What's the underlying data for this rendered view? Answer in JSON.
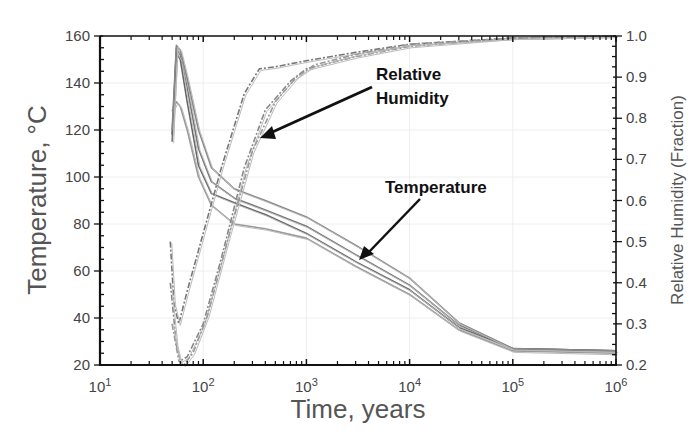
{
  "chart_data": {
    "type": "line",
    "title": "",
    "xlabel": "Time, years",
    "ylabel": "Temperature, °C",
    "y2label": "Relative Humidity (Fraction)",
    "xscale": "log",
    "xlim": [
      10,
      1000000
    ],
    "ylim": [
      20,
      160
    ],
    "y2lim": [
      0.2,
      1.0
    ],
    "grid": true,
    "legend": "none",
    "x_ticks": [
      "10^1",
      "10^2",
      "10^3",
      "10^4",
      "10^5",
      "10^6"
    ],
    "x_tick_values": [
      10,
      100,
      1000,
      10000,
      100000,
      1000000
    ],
    "y_ticks": [
      20,
      40,
      60,
      80,
      100,
      120,
      140,
      160
    ],
    "y2_ticks": [
      0.2,
      0.3,
      0.4,
      0.5,
      0.6,
      0.7,
      0.8,
      0.9,
      1.0
    ],
    "annotations": [
      {
        "text": "Relative Humidity",
        "points_to": {
          "x": 380,
          "y2": 0.78
        }
      },
      {
        "text": "Temperature",
        "points_to": {
          "x": 3500,
          "y": 62
        }
      }
    ],
    "series": [
      {
        "name": "Temperature (high case)",
        "axis": "left",
        "x": [
          50,
          55,
          60,
          70,
          90,
          120,
          200,
          400,
          1000,
          3000,
          10000,
          30000,
          100000,
          1000000
        ],
        "y": [
          115,
          155,
          152,
          138,
          112,
          98,
          91,
          86,
          79,
          67,
          54,
          37,
          27,
          26
        ]
      },
      {
        "name": "Temperature (mid case)",
        "axis": "left",
        "x": [
          50,
          55,
          60,
          70,
          90,
          120,
          200,
          400,
          1000,
          3000,
          10000,
          30000,
          100000,
          1000000
        ],
        "y": [
          118,
          153,
          150,
          132,
          105,
          93,
          89,
          84,
          76,
          64,
          52,
          36,
          27,
          26
        ]
      },
      {
        "name": "Temperature (low case)",
        "axis": "left",
        "x": [
          50,
          55,
          60,
          70,
          90,
          120,
          200,
          400,
          1000,
          3000,
          10000,
          30000,
          100000,
          1000000
        ],
        "y": [
          128,
          132,
          130,
          120,
          100,
          88,
          80,
          78,
          74,
          62,
          50,
          35,
          26,
          25
        ]
      },
      {
        "name": "Temperature (upper envelope)",
        "axis": "left",
        "x": [
          50,
          55,
          60,
          70,
          90,
          120,
          200,
          400,
          1000,
          3000,
          10000,
          30000,
          100000,
          1000000
        ],
        "y": [
          120,
          156,
          154,
          142,
          120,
          104,
          95,
          90,
          83,
          71,
          57,
          38,
          27,
          26
        ]
      },
      {
        "name": "Relative Humidity (fast case)",
        "axis": "right",
        "x": [
          48,
          52,
          58,
          70,
          100,
          150,
          250,
          350,
          500,
          1000,
          3000,
          10000,
          100000,
          1000000
        ],
        "y": [
          0.5,
          0.35,
          0.3,
          0.38,
          0.52,
          0.68,
          0.86,
          0.92,
          0.925,
          0.94,
          0.96,
          0.98,
          0.995,
          1.0
        ]
      },
      {
        "name": "Relative Humidity (mid case)",
        "axis": "right",
        "x": [
          48,
          55,
          60,
          70,
          100,
          150,
          250,
          400,
          700,
          1000,
          3000,
          10000,
          100000,
          1000000
        ],
        "y": [
          0.4,
          0.25,
          0.21,
          0.22,
          0.3,
          0.46,
          0.68,
          0.82,
          0.89,
          0.92,
          0.95,
          0.975,
          0.995,
          1.0
        ]
      },
      {
        "name": "Relative Humidity (slow case)",
        "axis": "right",
        "x": [
          50,
          58,
          65,
          80,
          110,
          180,
          300,
          500,
          800,
          1200,
          3000,
          10000,
          100000,
          1000000
        ],
        "y": [
          0.3,
          0.21,
          0.2,
          0.23,
          0.32,
          0.52,
          0.72,
          0.84,
          0.9,
          0.93,
          0.955,
          0.98,
          0.995,
          1.0
        ]
      }
    ]
  },
  "page": {
    "top_fragment": "by lengths"
  }
}
